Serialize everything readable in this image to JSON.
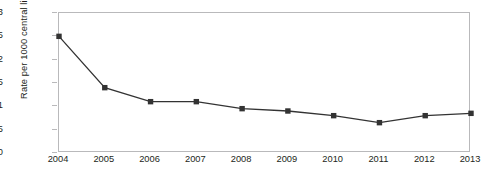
{
  "chart_data": {
    "type": "line",
    "title": "",
    "xlabel": "",
    "ylabel": "Rate per 1000 central line days",
    "categories": [
      "2004",
      "2005",
      "2006",
      "2007",
      "2008",
      "2009",
      "2010",
      "2011",
      "2012",
      "2013"
    ],
    "values": [
      2.5,
      1.4,
      1.1,
      1.1,
      0.95,
      0.9,
      0.8,
      0.65,
      0.8,
      0.85
    ],
    "ylim": [
      0,
      3
    ],
    "yticks": [
      "0",
      "0.5",
      "1",
      "1.5",
      "2",
      "2.5",
      "3"
    ],
    "ytick_values": [
      0,
      0.5,
      1,
      1.5,
      2,
      2.5,
      3
    ],
    "grid": false,
    "legend": null,
    "series_color": "#333333",
    "marker": "square",
    "axis_color": "#b9b9bb",
    "text_color": "#231f20"
  }
}
